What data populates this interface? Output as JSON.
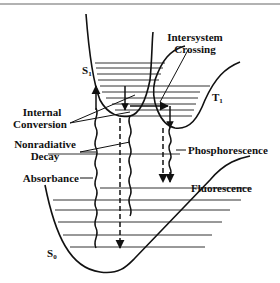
{
  "diagram": {
    "states": {
      "s1": {
        "symbol": "S",
        "subscript": "1"
      },
      "t1": {
        "symbol": "T",
        "subscript": "1"
      },
      "s0": {
        "symbol": "S",
        "subscript": "0"
      }
    },
    "labels": {
      "intersystem_line1": "Intersystem",
      "intersystem_line2": "Crossing",
      "internal_line1": "Internal",
      "internal_line2": "Conversion",
      "nonrad_line1": "Nonradiative",
      "nonrad_line2": "Decay",
      "absorbance": "Absorbance",
      "phosphorescence": "Phosphorescence",
      "fluorescence": "Fluorescence"
    }
  }
}
